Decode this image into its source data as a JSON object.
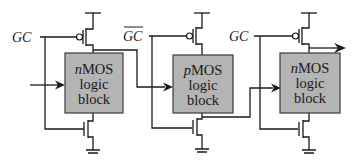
{
  "diagram": {
    "stages": [
      {
        "clock_label": "GC",
        "clock_inverted": false,
        "block_prefix": "n",
        "block_line1_rest": "MOS",
        "block_line2": "logic",
        "block_line3": "block"
      },
      {
        "clock_label": "GC",
        "clock_inverted": true,
        "block_prefix": "p",
        "block_line1_rest": "MOS",
        "block_line2": "logic",
        "block_line3": "block"
      },
      {
        "clock_label": "GC",
        "clock_inverted": false,
        "block_prefix": "n",
        "block_line1_rest": "MOS",
        "block_line2": "logic",
        "block_line3": "block"
      }
    ],
    "colors": {
      "block_fill": "#b4b4b4",
      "wire": "#1a1a1a",
      "background": "#ffffff"
    }
  }
}
